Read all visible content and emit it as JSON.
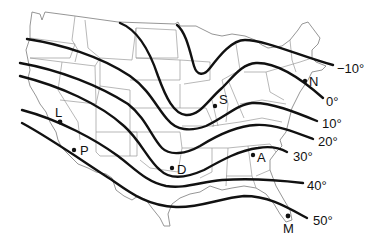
{
  "map": {
    "type": "isotherm map",
    "region": "contiguous United States",
    "colors": {
      "lines": "#111111",
      "borders": "#8a8a8a",
      "background": "#ffffff"
    },
    "isotherms": [
      {
        "label": "−10°",
        "value": -10
      },
      {
        "label": "0°",
        "value": 0
      },
      {
        "label": "10°",
        "value": 10
      },
      {
        "label": "20°",
        "value": 20
      },
      {
        "label": "30°",
        "value": 30
      },
      {
        "label": "40°",
        "value": 40
      },
      {
        "label": "50°",
        "value": 50
      }
    ],
    "points": [
      {
        "label": "N"
      },
      {
        "label": "S"
      },
      {
        "label": "L"
      },
      {
        "label": "P"
      },
      {
        "label": "D"
      },
      {
        "label": "A"
      },
      {
        "label": "M"
      }
    ]
  }
}
